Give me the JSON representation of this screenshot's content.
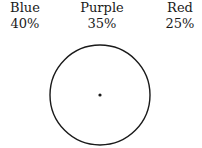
{
  "diagram": {
    "type": "blank-circle-with-center",
    "labels": [
      {
        "name": "Blue",
        "percent": "40%"
      },
      {
        "name": "Purple",
        "percent": "35%"
      },
      {
        "name": "Red",
        "percent": "25%"
      }
    ],
    "circle": {
      "cx": 100,
      "cy": 95,
      "r": 50,
      "stroke": "#1a1a1a"
    },
    "center_dot": {
      "cx": 100,
      "cy": 95,
      "r": 1.6
    }
  },
  "chart_data": {
    "type": "pie",
    "categories": [
      "Blue",
      "Purple",
      "Red"
    ],
    "values": [
      40,
      35,
      25
    ],
    "title": "",
    "note": "Empty circle with center point; percentages given as labels above"
  }
}
